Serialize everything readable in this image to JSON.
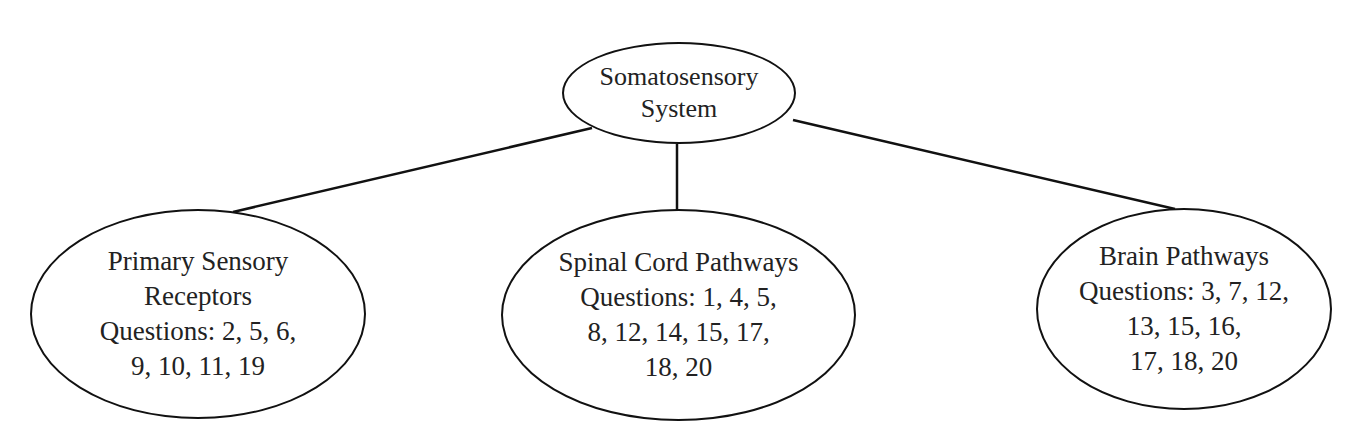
{
  "diagram": {
    "type": "tree",
    "root": {
      "id": "root",
      "lines": [
        "Somatosensory",
        "System"
      ]
    },
    "children": [
      {
        "id": "n1",
        "title_lines": [
          "Primary Sensory",
          "Receptors"
        ],
        "question_lines": [
          "Questions: 2, 5, 6,",
          "9, 10, 11, 19"
        ],
        "questions": [
          2,
          5,
          6,
          9,
          10,
          11,
          19
        ]
      },
      {
        "id": "n2",
        "title_lines": [
          "Spinal Cord Pathways"
        ],
        "question_lines": [
          "Questions: 1, 4, 5,",
          "8, 12, 14, 15, 17,",
          "18, 20"
        ],
        "questions": [
          1,
          4,
          5,
          8,
          12,
          14,
          15,
          17,
          18,
          20
        ]
      },
      {
        "id": "n3",
        "title_lines": [
          "Brain Pathways"
        ],
        "question_lines": [
          "Questions: 3, 7, 12,",
          "13, 15, 16,",
          "17, 18, 20"
        ],
        "questions": [
          3,
          7,
          12,
          13,
          15,
          16,
          17,
          18,
          20
        ]
      }
    ],
    "edges": [
      {
        "from": "root",
        "to": "n1"
      },
      {
        "from": "root",
        "to": "n2"
      },
      {
        "from": "root",
        "to": "n3"
      }
    ],
    "colors": {
      "stroke": "#111111",
      "text": "#222222",
      "background": "#ffffff"
    }
  }
}
